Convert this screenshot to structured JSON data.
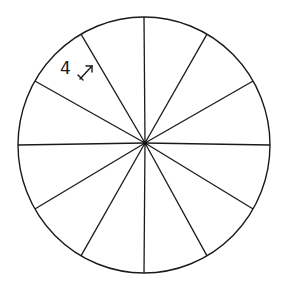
{
  "diagram": {
    "type": "circle-divided-into-sectors",
    "sector_count": 12,
    "sector_angle_degrees": 30,
    "center": {
      "x": 145,
      "y": 143
    },
    "radius": 127,
    "stroke_color": "#1a1a1a",
    "background_color": "#ffffff",
    "annotation": {
      "text": "4",
      "icon": "double-headed-arrow-icon",
      "sector_index_from_top_clockwise": 10
    }
  }
}
